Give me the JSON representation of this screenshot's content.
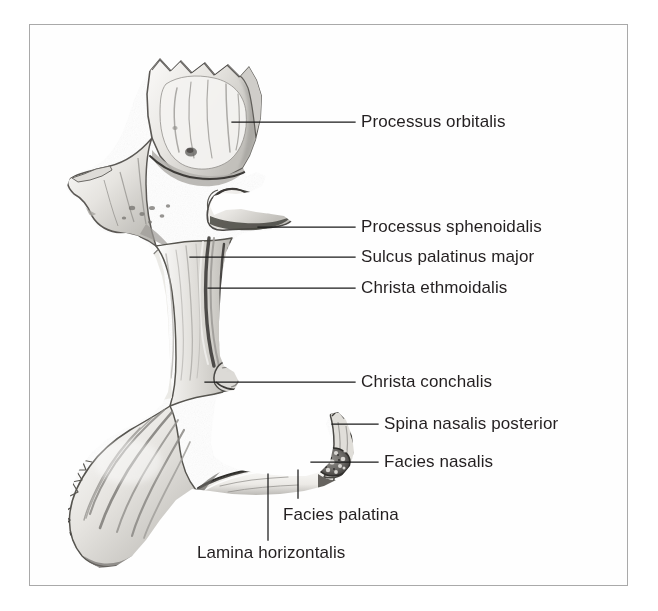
{
  "figure": {
    "kind": "anatomical-illustration",
    "style": "grayscale pencil and wash drawing",
    "frame_color": "#a9a9a9",
    "background_color": "#ffffff",
    "text_color": "#231f20",
    "leader_color": "#1a1a1a"
  },
  "labels": [
    {
      "id": "processus-orbitalis",
      "text": "Processus orbitalis",
      "x": 361,
      "y": 112,
      "leader": {
        "type": "horizontal",
        "x1": 232,
        "y1": 122,
        "x2": 355,
        "y2": 122
      }
    },
    {
      "id": "processus-sphenoidalis",
      "text": "Processus sphenoidalis",
      "x": 361,
      "y": 217,
      "leader": {
        "type": "horizontal",
        "x1": 258,
        "y1": 227,
        "x2": 355,
        "y2": 227
      }
    },
    {
      "id": "sulcus-palatinus-major",
      "text": "Sulcus palatinus major",
      "x": 361,
      "y": 247,
      "leader": {
        "type": "horizontal",
        "x1": 190,
        "y1": 257,
        "x2": 355,
        "y2": 257
      }
    },
    {
      "id": "christa-ethmoidalis",
      "text": "Christa ethmoidalis",
      "x": 361,
      "y": 278,
      "leader": {
        "type": "horizontal",
        "x1": 208,
        "y1": 288,
        "x2": 355,
        "y2": 288
      }
    },
    {
      "id": "christa-conchalis",
      "text": "Christa conchalis",
      "x": 361,
      "y": 372,
      "leader": {
        "type": "horizontal",
        "x1": 205,
        "y1": 382,
        "x2": 355,
        "y2": 382
      }
    },
    {
      "id": "spina-nasalis-posterior",
      "text": "Spina nasalis posterior",
      "x": 384,
      "y": 414,
      "leader": {
        "type": "horizontal",
        "x1": 332,
        "y1": 424,
        "x2": 378,
        "y2": 424
      }
    },
    {
      "id": "facies-nasalis",
      "text": "Facies nasalis",
      "x": 384,
      "y": 452,
      "leader": {
        "type": "horizontal",
        "x1": 311,
        "y1": 462,
        "x2": 378,
        "y2": 462
      }
    },
    {
      "id": "facies-palatina",
      "text": "Facies palatina",
      "x": 283,
      "y": 505,
      "leader": {
        "type": "vertical",
        "x1": 298,
        "y1": 470,
        "x2": 298,
        "y2": 498
      }
    },
    {
      "id": "lamina-horizontalis",
      "text": "Lamina horizontalis",
      "x": 197,
      "y": 543,
      "leader": {
        "type": "vertical",
        "x1": 268,
        "y1": 474,
        "x2": 268,
        "y2": 540
      }
    }
  ]
}
